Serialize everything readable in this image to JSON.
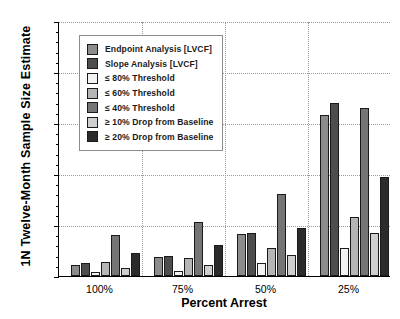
{
  "chart_data": {
    "type": "bar",
    "title": "",
    "xlabel": "Percent Arrest",
    "ylabel": "1N Twelve-Month Sample Size Estimate",
    "categories": [
      "100%",
      "75%",
      "50%",
      "25%"
    ],
    "ylim": [
      0,
      500
    ],
    "yticks": [
      0,
      100,
      200,
      300,
      400,
      500
    ],
    "grid": "dotted horizontal and vertical",
    "legend_position": "upper-left inside plot",
    "series": [
      {
        "name": "Endpoint Analysis [LVCF]",
        "color": "#8c8c8c",
        "values": [
          22,
          38,
          82,
          315
        ]
      },
      {
        "name": "Slope Analysis [LVCF]",
        "color": "#4d4d4d",
        "values": [
          25,
          40,
          85,
          340
        ]
      },
      {
        "name": "≤ 80% Threshold",
        "color": "#f2f2f2",
        "values": [
          8,
          10,
          25,
          55
        ]
      },
      {
        "name": "≤ 60% Threshold",
        "color": "#b5b5b5",
        "values": [
          28,
          35,
          55,
          115
        ]
      },
      {
        "name": "≤ 40% Threshold",
        "color": "#757575",
        "values": [
          80,
          105,
          160,
          330
        ]
      },
      {
        "name": "≥ 10% Drop from Baseline",
        "color": "#cfcfcf",
        "values": [
          15,
          22,
          42,
          85
        ]
      },
      {
        "name": "≥ 20% Drop from Baseline",
        "color": "#2b2b2b",
        "values": [
          45,
          60,
          95,
          195
        ]
      }
    ]
  },
  "axis": {
    "ytick_labels": [
      "0",
      "100",
      "200",
      "300",
      "400",
      "500"
    ],
    "xtick_labels": [
      "100%",
      "75%",
      "50%",
      "25%"
    ]
  }
}
